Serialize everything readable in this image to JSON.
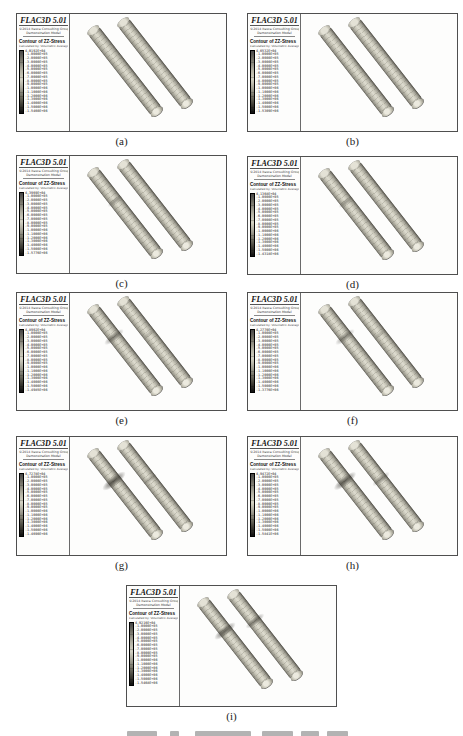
{
  "figure": {
    "legend_header": {
      "software_title": "FLAC3D 5.01",
      "vendor_line": "©2014 Itasca Consulting Group, Inc.",
      "model_line": "Demonstration Model",
      "contour_title": "Contour of ZZ-Stress",
      "calc_line": "Calculated by: Volumetric Averaging"
    },
    "colors": {
      "panel_border": "#4f4f4f",
      "specimen_mid": "#dedcd0",
      "specimen_edge": "#66645b",
      "flaw_dark": "#2f2d26",
      "colorbar_top": "#474747",
      "colorbar_light_mid": "#d2d0c2",
      "colorbar_bottom": "#101010"
    },
    "panels": [
      {
        "id": "a",
        "label": "(a)",
        "pos": {
          "left": 16,
          "top": 13,
          "h": 119
        },
        "entries": [
          "4.0192E+04",
          "-1.0000E+05",
          "-2.0000E+05",
          "-3.0000E+05",
          "-4.0000E+05",
          "-5.0000E+05",
          "-6.0000E+05",
          "-7.0000E+05",
          "-8.0000E+05",
          "-9.0000E+05",
          "-1.0000E+06",
          "-1.1000E+06",
          "-1.2000E+06",
          "-1.3000E+06",
          "-1.4000E+06",
          "-1.5000E+06",
          "-1.5460E+06"
        ],
        "blobs": []
      },
      {
        "id": "b",
        "label": "(b)",
        "pos": {
          "left": 247,
          "top": 13,
          "h": 119
        },
        "entries": [
          "4.6532E+04",
          "-1.0000E+05",
          "-2.0000E+05",
          "-3.0000E+05",
          "-4.0000E+05",
          "-5.0000E+05",
          "-6.0000E+05",
          "-7.0000E+05",
          "-8.0000E+05",
          "-9.0000E+05",
          "-1.0000E+06",
          "-1.1000E+06",
          "-1.2000E+06",
          "-1.3000E+06",
          "-1.4000E+06",
          "-1.5000E+06",
          "-1.5309E+06"
        ],
        "blobs": []
      },
      {
        "id": "c",
        "label": "(c)",
        "pos": {
          "left": 16,
          "top": 155,
          "h": 119
        },
        "entries": [
          "4.3969E+04",
          "-1.0000E+05",
          "-2.0000E+05",
          "-3.0000E+05",
          "-4.0000E+05",
          "-5.0000E+05",
          "-6.0000E+05",
          "-7.0000E+05",
          "-8.0000E+05",
          "-9.0000E+05",
          "-1.0000E+06",
          "-1.1000E+06",
          "-1.2000E+06",
          "-1.3000E+06",
          "-1.4000E+06",
          "-1.5000E+06",
          "-1.5776E+06"
        ],
        "blobs": [
          {
            "x": 45,
            "y": 45,
            "s": 0.75,
            "o": 0.38
          }
        ]
      },
      {
        "id": "d",
        "label": "(d)",
        "pos": {
          "left": 247,
          "top": 156,
          "h": 119
        },
        "entries": [
          "4.1368E+04",
          "-1.0000E+05",
          "-2.0000E+05",
          "-3.0000E+05",
          "-4.0000E+05",
          "-5.0000E+05",
          "-6.0000E+05",
          "-7.0000E+05",
          "-8.0000E+05",
          "-9.0000E+05",
          "-1.0000E+06",
          "-1.1000E+06",
          "-1.2000E+06",
          "-1.3000E+06",
          "-1.4000E+06",
          "-1.5000E+06",
          "-1.4318E+06"
        ],
        "blobs": [
          {
            "x": 45,
            "y": 45,
            "s": 0.75,
            "o": 0.38
          }
        ]
      },
      {
        "id": "e",
        "label": "(e)",
        "pos": {
          "left": 16,
          "top": 292,
          "h": 119
        },
        "entries": [
          "4.8902E+04",
          "-1.0000E+05",
          "-2.0000E+05",
          "-3.0000E+05",
          "-4.0000E+05",
          "-5.0000E+05",
          "-6.0000E+05",
          "-7.0000E+05",
          "-8.0000E+05",
          "-9.0000E+05",
          "-1.0000E+06",
          "-1.1000E+06",
          "-1.2000E+06",
          "-1.3000E+06",
          "-1.4000E+06",
          "-1.5000E+06",
          "-1.4985E+06"
        ],
        "blobs": [
          {
            "x": 44,
            "y": 44,
            "s": 1.0,
            "o": 0.58
          },
          {
            "x": 79,
            "y": 41,
            "s": 0.6,
            "o": 0.22
          }
        ]
      },
      {
        "id": "f",
        "label": "(f)",
        "pos": {
          "left": 247,
          "top": 292,
          "h": 119
        },
        "entries": [
          "4.2770E+04",
          "-1.0000E+05",
          "-2.0000E+05",
          "-3.0000E+05",
          "-4.0000E+05",
          "-5.0000E+05",
          "-6.0000E+05",
          "-7.0000E+05",
          "-8.0000E+05",
          "-9.0000E+05",
          "-1.0000E+06",
          "-1.1000E+06",
          "-1.2000E+06",
          "-1.3000E+06",
          "-1.4000E+06",
          "-1.5000E+06",
          "-1.3776E+06"
        ],
        "blobs": [
          {
            "x": 44,
            "y": 44,
            "s": 1.0,
            "o": 0.52
          },
          {
            "x": 79,
            "y": 41,
            "s": 0.6,
            "o": 0.22
          }
        ]
      },
      {
        "id": "g",
        "label": "(g)",
        "pos": {
          "left": 16,
          "top": 436,
          "h": 120
        },
        "entries": [
          "4.7278E+04",
          "-1.0000E+05",
          "-2.0000E+05",
          "-3.0000E+05",
          "-4.0000E+05",
          "-5.0000E+05",
          "-6.0000E+05",
          "-7.0000E+05",
          "-8.0000E+05",
          "-9.0000E+05",
          "-1.0000E+06",
          "-1.1000E+06",
          "-1.2000E+06",
          "-1.3000E+06",
          "-1.4000E+06",
          "-1.5000E+06",
          "-1.4690E+06"
        ],
        "blobs": [
          {
            "x": 44,
            "y": 44,
            "s": 1.2,
            "o": 0.8
          },
          {
            "x": 80,
            "y": 42,
            "s": 0.7,
            "o": 0.28
          }
        ]
      },
      {
        "id": "h",
        "label": "(h)",
        "pos": {
          "left": 247,
          "top": 436,
          "h": 120
        },
        "entries": [
          "4.9472E+04",
          "-1.0000E+05",
          "-2.0000E+05",
          "-3.0000E+05",
          "-4.0000E+05",
          "-5.0000E+05",
          "-6.0000E+05",
          "-7.0000E+05",
          "-8.0000E+05",
          "-9.0000E+05",
          "-1.0000E+06",
          "-1.1000E+06",
          "-1.2000E+06",
          "-1.3000E+06",
          "-1.4000E+06",
          "-1.5000E+06",
          "-1.5841E+06"
        ],
        "blobs": [
          {
            "x": 44,
            "y": 44,
            "s": 1.15,
            "o": 0.75
          },
          {
            "x": 80,
            "y": 42,
            "s": 0.9,
            "o": 0.45
          }
        ]
      },
      {
        "id": "i",
        "label": "(i)",
        "pos": {
          "left": 126,
          "top": 585,
          "h": 122
        },
        "entries": [
          "4.9216E+04",
          "-1.0000E+05",
          "-2.0000E+05",
          "-3.0000E+05",
          "-4.0000E+05",
          "-5.0000E+05",
          "-6.0000E+05",
          "-7.0000E+05",
          "-8.0000E+05",
          "-9.0000E+05",
          "-1.0000E+06",
          "-1.1000E+06",
          "-1.2000E+06",
          "-1.3000E+06",
          "-1.4000E+06",
          "-1.5000E+06",
          "-1.5468E+06"
        ],
        "blobs": [
          {
            "x": 45,
            "y": 45,
            "s": 1.1,
            "o": 0.72
          },
          {
            "x": 75,
            "y": 35,
            "s": 0.95,
            "o": 0.6
          }
        ]
      }
    ],
    "caption_clipped": {
      "visible": true,
      "blocks": [
        {
          "x": 127,
          "w": 30
        },
        {
          "x": 170,
          "w": 9
        },
        {
          "x": 195,
          "w": 56
        },
        {
          "x": 262,
          "w": 31
        },
        {
          "x": 301,
          "w": 18
        },
        {
          "x": 327,
          "w": 21
        }
      ]
    }
  }
}
